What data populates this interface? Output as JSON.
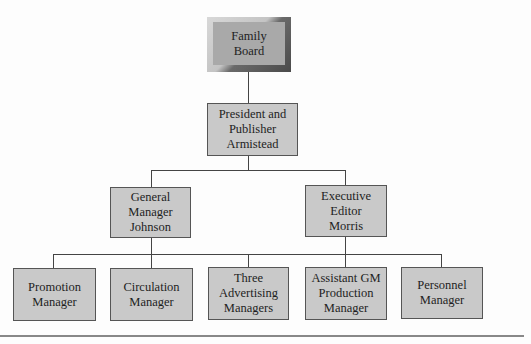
{
  "chart": {
    "root": {
      "label": "Family\nBoard"
    },
    "level1": {
      "label": "President and\nPublisher\nArmistead"
    },
    "level2": [
      {
        "label": "General\nManager\nJohnson"
      },
      {
        "label": "Executive\nEditor\nMorris"
      }
    ],
    "level3": [
      {
        "label": "Promotion\nManager"
      },
      {
        "label": "Circulation\nManager"
      },
      {
        "label": "Three\nAdvertising\nManagers"
      },
      {
        "label": "Assistant GM\nProduction\nManager"
      },
      {
        "label": "Personnel\nManager"
      }
    ]
  },
  "colors": {
    "box_fill": "#c9c9c9",
    "root_fill": "#a8a8a8",
    "line": "#444444"
  }
}
